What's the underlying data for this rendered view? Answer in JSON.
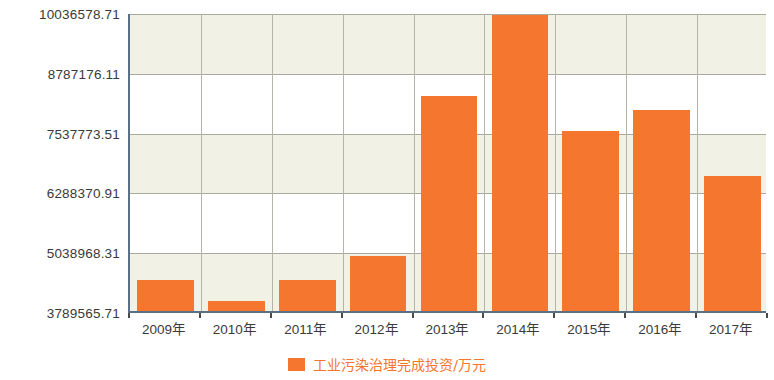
{
  "chart_data": {
    "type": "bar",
    "title": "",
    "subtitle": "",
    "xlabel": "",
    "ylabel": "",
    "categories": [
      "2009年",
      "2010年",
      "2011年",
      "2012年",
      "2013年",
      "2014年",
      "2015年",
      "2016年",
      "2017年"
    ],
    "series": [
      {
        "name": "工业污染治理完成投资/万元",
        "color": "#f4762f",
        "values": [
          4440000,
          3990000,
          4440000,
          4940000,
          8290000,
          9980000,
          7560000,
          7980000,
          6610000
        ]
      }
    ],
    "ylim": [
      3789565.71,
      10036578.71
    ],
    "ytick_labels": [
      "10036578.71",
      "8787176.11",
      "7537773.51",
      "6288370.91",
      "5038968.31",
      "3789565.71"
    ],
    "ytick_values": [
      10036578.71,
      8787176.11,
      7537773.51,
      6288370.91,
      5038968.31,
      3789565.71
    ],
    "grid": true,
    "legend_position": "bottom-center",
    "alternating_band_color": "#f2f1e6",
    "axis_color": "#5b6f86",
    "gridline_color": "#a9a99c",
    "plot_background": "#ffffff"
  },
  "legend": {
    "entries": [
      {
        "label": "工业污染治理完成投资/万元",
        "color": "#f4762f"
      }
    ]
  }
}
